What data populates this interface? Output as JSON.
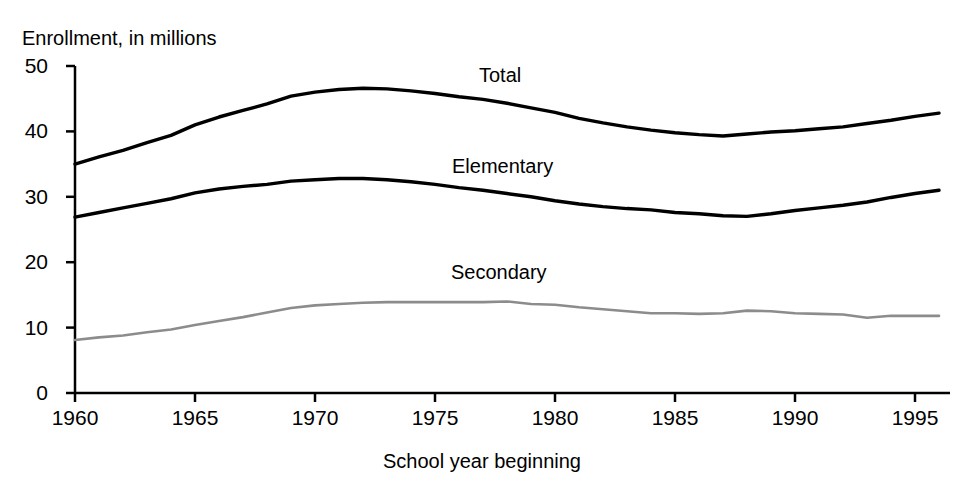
{
  "chart_data": {
    "type": "line",
    "title": "",
    "ylabel": "Enrollment, in millions",
    "xlabel": "School year beginning",
    "xlim": [
      1960,
      1996
    ],
    "ylim": [
      0,
      50
    ],
    "yticks": [
      0,
      10,
      20,
      30,
      40,
      50
    ],
    "xticks": [
      1960,
      1965,
      1970,
      1975,
      1980,
      1985,
      1990,
      1995
    ],
    "grid": false,
    "legend_position": "inline-labels",
    "x": [
      1960,
      1961,
      1962,
      1963,
      1964,
      1965,
      1966,
      1967,
      1968,
      1969,
      1970,
      1971,
      1972,
      1973,
      1974,
      1975,
      1976,
      1977,
      1978,
      1979,
      1980,
      1981,
      1982,
      1983,
      1984,
      1985,
      1986,
      1987,
      1988,
      1989,
      1990,
      1991,
      1992,
      1993,
      1994,
      1995,
      1996
    ],
    "series": [
      {
        "name": "Total",
        "color": "#000000",
        "values": [
          35.0,
          36.1,
          37.1,
          38.3,
          39.4,
          41.0,
          42.2,
          43.2,
          44.2,
          45.4,
          46.0,
          46.4,
          46.6,
          46.5,
          46.2,
          45.8,
          45.3,
          44.9,
          44.3,
          43.6,
          42.9,
          42.0,
          41.3,
          40.7,
          40.2,
          39.8,
          39.5,
          39.3,
          39.6,
          39.9,
          40.1,
          40.4,
          40.7,
          41.2,
          41.7,
          42.3,
          42.8
        ]
      },
      {
        "name": "Elementary",
        "color": "#000000",
        "values": [
          26.9,
          27.6,
          28.3,
          29.0,
          29.7,
          30.6,
          31.2,
          31.6,
          31.9,
          32.4,
          32.6,
          32.8,
          32.8,
          32.6,
          32.3,
          31.9,
          31.4,
          31.0,
          30.5,
          30.0,
          29.4,
          28.9,
          28.5,
          28.2,
          28.0,
          27.6,
          27.4,
          27.1,
          27.0,
          27.4,
          27.9,
          28.3,
          28.7,
          29.2,
          29.9,
          30.5,
          31.0
        ]
      },
      {
        "name": "Secondary",
        "color": "#8c8c8c",
        "values": [
          8.1,
          8.5,
          8.8,
          9.3,
          9.7,
          10.4,
          11.0,
          11.6,
          12.3,
          13.0,
          13.4,
          13.6,
          13.8,
          13.9,
          13.9,
          13.9,
          13.9,
          13.9,
          14.0,
          13.6,
          13.5,
          13.1,
          12.8,
          12.5,
          12.2,
          12.2,
          12.1,
          12.2,
          12.6,
          12.5,
          12.2,
          12.1,
          12.0,
          11.5,
          11.8,
          11.8,
          11.8
        ]
      }
    ],
    "inline_labels": [
      {
        "text": "Total",
        "x_px": 479,
        "y_px": 64
      },
      {
        "text": "Elementary",
        "x_px": 452,
        "y_px": 155
      },
      {
        "text": "Secondary",
        "x_px": 451,
        "y_px": 261
      }
    ],
    "axis_color": "#000000"
  }
}
